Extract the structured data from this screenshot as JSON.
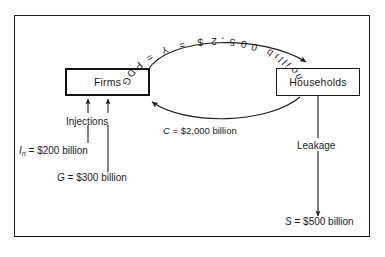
{
  "diagram": {
    "frame": {
      "border_color": "#1c1c1c",
      "background": "#ffffff"
    },
    "sectors": [
      {
        "id": "firms",
        "label": "Firms"
      },
      {
        "id": "households",
        "label": "Households"
      }
    ],
    "flows": {
      "gdp": {
        "label": "GDP = Y = $2,500 billion",
        "glyphs": "GDP = Y = $2,500 billion",
        "symbol": "Y",
        "value": 2500,
        "units": "billion",
        "currency": "$",
        "direction": "firms-to-households"
      },
      "consumption": {
        "symbol": "C",
        "equals": "=",
        "amount": "$2,000 billion",
        "value": 2000,
        "units": "billion",
        "direction": "households-to-firms"
      }
    },
    "injections": {
      "label": "Injections",
      "items": [
        {
          "symbol": "I",
          "subscript": "n",
          "equals": "=",
          "amount": "$200 billion",
          "value": 200,
          "units": "billion"
        },
        {
          "symbol": "G",
          "subscript": "",
          "equals": "=",
          "amount": "$300 billion",
          "value": 300,
          "units": "billion"
        }
      ]
    },
    "leakage": {
      "label": "Leakage",
      "symbol": "S",
      "equals": "=",
      "amount": "$500 billion",
      "value": 500,
      "units": "billion"
    }
  },
  "chart_data": {
    "type": "diagram",
    "nodes": [
      "Firms",
      "Households"
    ],
    "series": [
      {
        "name": "GDP = Y",
        "values": [
          2500
        ],
        "units": "billion",
        "from": "Firms",
        "to": "Households"
      },
      {
        "name": "C",
        "values": [
          2000
        ],
        "units": "billion",
        "from": "Households",
        "to": "Firms"
      },
      {
        "name": "I_n",
        "values": [
          200
        ],
        "units": "billion",
        "from": "Injections",
        "to": "Firms"
      },
      {
        "name": "G",
        "values": [
          300
        ],
        "units": "billion",
        "from": "Injections",
        "to": "Firms"
      },
      {
        "name": "S",
        "values": [
          500
        ],
        "units": "billion",
        "from": "Households",
        "to": "Leakage"
      }
    ]
  }
}
